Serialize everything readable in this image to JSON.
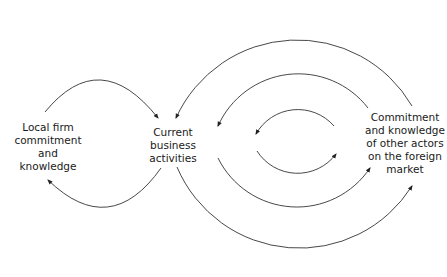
{
  "diagram": {
    "nodes": {
      "local": {
        "lines": [
          "Local firm",
          "commitment",
          "and",
          "knowledge"
        ]
      },
      "current": {
        "lines": [
          "Current",
          "business",
          "activities"
        ]
      },
      "other": {
        "lines": [
          "Commitment",
          "and knowledge",
          "of other actors",
          "on the foreign",
          "market"
        ]
      }
    },
    "edges": [
      {
        "from": "Local firm commitment and knowledge",
        "to": "Current business activities",
        "shape": "upper arc"
      },
      {
        "from": "Current business activities",
        "to": "Local firm commitment and knowledge",
        "shape": "lower arc"
      },
      {
        "from": "Commitment and knowledge of other actors on the foreign market",
        "to": "Current business activities",
        "shape": "outer upper arc"
      },
      {
        "from": "Current business activities",
        "to": "Commitment and knowledge of other actors on the foreign market",
        "shape": "outer lower arc"
      },
      {
        "from": "Commitment and knowledge of other actors on the foreign market",
        "to": "Current business activities",
        "shape": "middle upper arc"
      },
      {
        "from": "Current business activities",
        "to": "Commitment and knowledge of other actors on the foreign market",
        "shape": "middle lower arc"
      },
      {
        "from": "inner right",
        "to": "inner left",
        "shape": "inner upper arc"
      },
      {
        "from": "inner left",
        "to": "inner right",
        "shape": "inner lower arc"
      }
    ],
    "colors": {
      "stroke": "#333333",
      "text": "#1a1a1a",
      "background": "#ffffff"
    }
  }
}
